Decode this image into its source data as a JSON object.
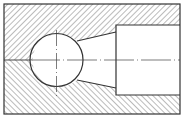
{
  "drawing": {
    "type": "sectional-view",
    "description": "Cross-section of a block with a spherical cavity connected by a tapered passage to a cylindrical bore",
    "colors": {
      "background": "#ffffff",
      "line": "#333333",
      "hatch": "#555555",
      "centerline": "#444444"
    },
    "outline": {
      "x": 4,
      "y": 4,
      "width": 176,
      "height": 110
    },
    "sphere": {
      "cx": 56.5,
      "cy": 60,
      "r": 26.5
    },
    "bore": {
      "x_start": 116,
      "y_top": 25,
      "y_bottom": 95,
      "x_end": 180
    },
    "taper": {
      "top": {
        "from": [
          77,
          41
        ],
        "to": [
          116,
          32
        ]
      },
      "bottom": {
        "from": [
          77,
          80
        ],
        "to": [
          116,
          88
        ]
      }
    },
    "centerline": {
      "horizontal_y": 60,
      "vertical_x": 56.5,
      "vertical_from": 30,
      "vertical_to": 96
    },
    "hatching": {
      "upper": "descending-diagonal",
      "lower": "ascending-diagonal",
      "spacing": 4
    }
  }
}
